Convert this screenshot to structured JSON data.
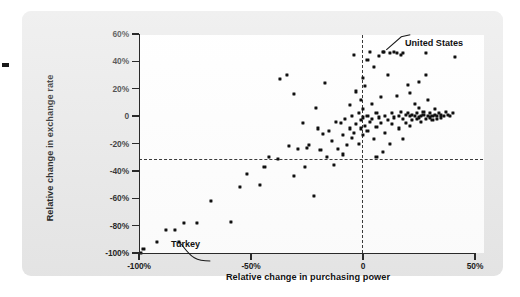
{
  "figure": {
    "background_color": "#e8e8e8",
    "plot_background_color": "#ffffff",
    "point_color": "#101010",
    "axis_color": "#2a2a2a"
  },
  "annotations": [
    {
      "name": "united-states",
      "label": "United States",
      "x": 9.5,
      "y": 47
    },
    {
      "name": "turkey",
      "label": "Turkey",
      "x": -82,
      "y": -92
    }
  ],
  "chart_data": {
    "type": "scatter",
    "title": "",
    "xlabel": "Relative change in purchasing power",
    "ylabel": "Relative change in exchange rate",
    "xlim": [
      -100,
      50
    ],
    "ylim": [
      -100,
      60
    ],
    "xticks": [
      -100,
      -50,
      0,
      50
    ],
    "xticklabels": [
      "-100%",
      "-50%",
      "0",
      "50%"
    ],
    "yticks": [
      60,
      40,
      20,
      0,
      -20,
      -40,
      -60,
      -80,
      -100
    ],
    "yticklabels": [
      "60%",
      "40%",
      "20%",
      "0",
      "-20%",
      "-40%",
      "-60%",
      "-80%",
      "-100%"
    ],
    "grid": false,
    "legend": null,
    "reference_lines": [
      {
        "axis": "y",
        "value": 0,
        "style": "dashed"
      },
      {
        "axis": "x",
        "value": 0,
        "style": "dashed"
      }
    ],
    "points": [
      [
        -99,
        -100
      ],
      [
        -98,
        -97
      ],
      [
        -92,
        -92
      ],
      [
        -88,
        -83
      ],
      [
        -84,
        -83
      ],
      [
        -80,
        -78
      ],
      [
        -74,
        -78
      ],
      [
        -68,
        -62
      ],
      [
        -59,
        -77
      ],
      [
        -55,
        -52
      ],
      [
        -52,
        -42
      ],
      [
        -46,
        -50
      ],
      [
        -44,
        -37
      ],
      [
        -42,
        -30
      ],
      [
        -38,
        -31
      ],
      [
        -37,
        27
      ],
      [
        -34,
        30
      ],
      [
        -33,
        -22
      ],
      [
        -31,
        16
      ],
      [
        -31,
        -44
      ],
      [
        -29,
        -24
      ],
      [
        -26,
        -37
      ],
      [
        -25,
        -23
      ],
      [
        -24,
        -21
      ],
      [
        -22,
        -58
      ],
      [
        -20,
        -9
      ],
      [
        -19,
        -25
      ],
      [
        -18,
        -13
      ],
      [
        -17,
        24
      ],
      [
        -16,
        -30
      ],
      [
        -15,
        -11
      ],
      [
        -14,
        -18
      ],
      [
        -13,
        -36
      ],
      [
        -12,
        -4
      ],
      [
        -11,
        -24
      ],
      [
        -10,
        -5
      ],
      [
        -9,
        -14
      ],
      [
        -9,
        -28
      ],
      [
        -8,
        -2
      ],
      [
        -7,
        -21
      ],
      [
        -6,
        8
      ],
      [
        -6,
        -9
      ],
      [
        -5,
        -16
      ],
      [
        -5,
        0
      ],
      [
        -4,
        45
      ],
      [
        -4,
        -12
      ],
      [
        -3,
        18
      ],
      [
        -3,
        -6
      ],
      [
        -2,
        2
      ],
      [
        -2,
        -20
      ],
      [
        -1,
        12
      ],
      [
        -1,
        -3
      ],
      [
        -1,
        -9
      ],
      [
        0,
        5
      ],
      [
        0,
        -1
      ],
      [
        0,
        -14
      ],
      [
        0,
        28
      ],
      [
        1,
        -7
      ],
      [
        1,
        22
      ],
      [
        2,
        0
      ],
      [
        2,
        -11
      ],
      [
        2,
        41
      ],
      [
        3,
        47
      ],
      [
        3,
        -4
      ],
      [
        4,
        9
      ],
      [
        4,
        -2
      ],
      [
        5,
        36
      ],
      [
        5,
        -17
      ],
      [
        6,
        2
      ],
      [
        6,
        -8
      ],
      [
        7,
        44
      ],
      [
        7,
        -1
      ],
      [
        8,
        14
      ],
      [
        8,
        -5
      ],
      [
        9,
        47
      ],
      [
        10,
        0
      ],
      [
        10,
        -12
      ],
      [
        11,
        30
      ],
      [
        11,
        -3
      ],
      [
        12,
        46
      ],
      [
        13,
        2
      ],
      [
        13,
        -6
      ],
      [
        14,
        47
      ],
      [
        14,
        -1
      ],
      [
        15,
        46
      ],
      [
        15,
        15
      ],
      [
        16,
        0
      ],
      [
        16,
        -9
      ],
      [
        17,
        45
      ],
      [
        17,
        3
      ],
      [
        18,
        46
      ],
      [
        18,
        -2
      ],
      [
        19,
        1
      ],
      [
        19,
        -5
      ],
      [
        20,
        2
      ],
      [
        20,
        23
      ],
      [
        21,
        0
      ],
      [
        21,
        -7
      ],
      [
        22,
        1
      ],
      [
        22,
        -3
      ],
      [
        23,
        9
      ],
      [
        23,
        0
      ],
      [
        24,
        -2
      ],
      [
        24,
        2
      ],
      [
        25,
        -1
      ],
      [
        25,
        6
      ],
      [
        26,
        0
      ],
      [
        26,
        -4
      ],
      [
        27,
        1
      ],
      [
        27,
        3
      ],
      [
        28,
        -2
      ],
      [
        28,
        46
      ],
      [
        29,
        0
      ],
      [
        29,
        12
      ],
      [
        30,
        -1
      ],
      [
        30,
        2
      ],
      [
        31,
        0
      ],
      [
        31,
        -3
      ],
      [
        32,
        1
      ],
      [
        32,
        5
      ],
      [
        33,
        -2
      ],
      [
        33,
        0
      ],
      [
        34,
        2
      ],
      [
        35,
        -1
      ],
      [
        35,
        1
      ],
      [
        36,
        0
      ],
      [
        37,
        3
      ],
      [
        38,
        1
      ],
      [
        39,
        0
      ],
      [
        40,
        2
      ],
      [
        41,
        43
      ],
      [
        28,
        30
      ],
      [
        25,
        25
      ],
      [
        21,
        17
      ],
      [
        18,
        -17
      ],
      [
        12,
        -20
      ],
      [
        9,
        -26
      ],
      [
        6,
        -30
      ],
      [
        -21,
        6
      ],
      [
        -27,
        -5
      ]
    ]
  }
}
